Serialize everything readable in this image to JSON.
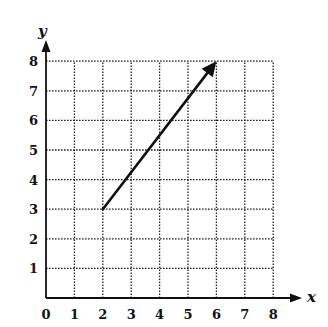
{
  "chart_data": {
    "type": "line",
    "title": "",
    "xlabel": "x",
    "ylabel": "y",
    "xlim": [
      0,
      8
    ],
    "ylim": [
      0,
      8
    ],
    "grid": true,
    "grid_style": "dotted",
    "x_ticks": [
      "0",
      "1",
      "2",
      "3",
      "4",
      "5",
      "6",
      "7",
      "8"
    ],
    "y_ticks": [
      "1",
      "2",
      "3",
      "4",
      "5",
      "6",
      "7",
      "8"
    ],
    "series": [
      {
        "name": "vector",
        "kind": "arrow",
        "x": [
          2,
          6
        ],
        "y": [
          3,
          8
        ],
        "start": [
          2,
          3
        ],
        "end": [
          6,
          8
        ],
        "arrowhead": "end"
      }
    ],
    "legend": null
  },
  "labels": {
    "x_axis": "x",
    "y_axis": "y",
    "origin": "0"
  },
  "colors": {
    "ink": "#111111",
    "background": "#ffffff"
  }
}
